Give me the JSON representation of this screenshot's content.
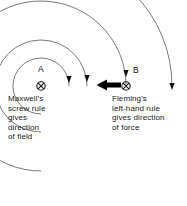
{
  "diagram": {
    "background_color": "#ffffff",
    "line_color": "#555555",
    "text_color": "#1a1a1a",
    "arrow_color": "#000000"
  },
  "conductors": [
    {
      "id": "A",
      "label": "A",
      "symbol": "current-into-page",
      "cx": 41,
      "cy": 86
    },
    {
      "id": "B",
      "label": "B",
      "symbol": "current-into-page",
      "cx": 126,
      "cy": 86
    }
  ],
  "force_arrow": {
    "name": "force-arrow",
    "direction": "left",
    "x_start": 121,
    "x_end": 97,
    "y": 85
  },
  "field_arcs": [
    {
      "r": 28,
      "arrowhead": true,
      "arrow_angle_deg": 0
    },
    {
      "r": 46,
      "arrowhead": true,
      "arrow_angle_deg": 0
    },
    {
      "r": 85,
      "arrowhead": true,
      "arrow_angle_deg": 0
    },
    {
      "r": 131,
      "arrowhead": true,
      "arrow_angle_deg": 0
    }
  ],
  "captions": {
    "maxwell": {
      "name": "maxwell-caption",
      "lines": [
        "Maxwell's",
        "screw rule",
        "gives",
        "direction",
        "of field"
      ]
    },
    "fleming": {
      "name": "fleming-caption",
      "lines": [
        "Fleming's",
        "left-hand rule",
        "gives direction",
        "of force"
      ]
    }
  }
}
